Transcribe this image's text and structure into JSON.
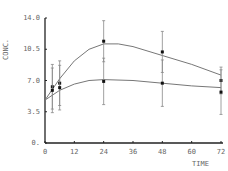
{
  "chart_data": {
    "type": "line",
    "title": "",
    "xlabel": "TIME",
    "ylabel": "CONC.",
    "x_ticks": [
      "0",
      "12",
      "24",
      "36",
      "48",
      "60",
      "72"
    ],
    "y_ticks": [
      "0.",
      "3.5",
      "7.0",
      "10.5",
      "14.0"
    ],
    "xlim": [
      0,
      72
    ],
    "ylim": [
      0,
      14
    ],
    "grid": false,
    "series": [
      {
        "name": "upper",
        "x": [
          3,
          6,
          24,
          48,
          72
        ],
        "y": [
          6.3,
          6.7,
          11.4,
          10.2,
          7.0
        ],
        "err": [
          2.5,
          2.5,
          2.3,
          2.3,
          1.5
        ],
        "fit": [
          [
            0,
            4.8
          ],
          [
            6,
            7.2
          ],
          [
            12,
            9.2
          ],
          [
            18,
            10.5
          ],
          [
            24,
            11.1
          ],
          [
            30,
            11.1
          ],
          [
            36,
            10.8
          ],
          [
            48,
            9.8
          ],
          [
            60,
            8.8
          ],
          [
            72,
            7.6
          ]
        ]
      },
      {
        "name": "lower",
        "x": [
          3,
          6,
          24,
          48,
          72
        ],
        "y": [
          5.9,
          6.2,
          6.9,
          6.7,
          5.7
        ],
        "err": [
          2.5,
          2.5,
          2.6,
          2.6,
          2.5
        ],
        "fit": [
          [
            0,
            4.8
          ],
          [
            6,
            5.9
          ],
          [
            12,
            6.6
          ],
          [
            18,
            7.0
          ],
          [
            24,
            7.1
          ],
          [
            36,
            7.0
          ],
          [
            48,
            6.7
          ],
          [
            60,
            6.4
          ],
          [
            72,
            6.2
          ]
        ]
      }
    ]
  }
}
